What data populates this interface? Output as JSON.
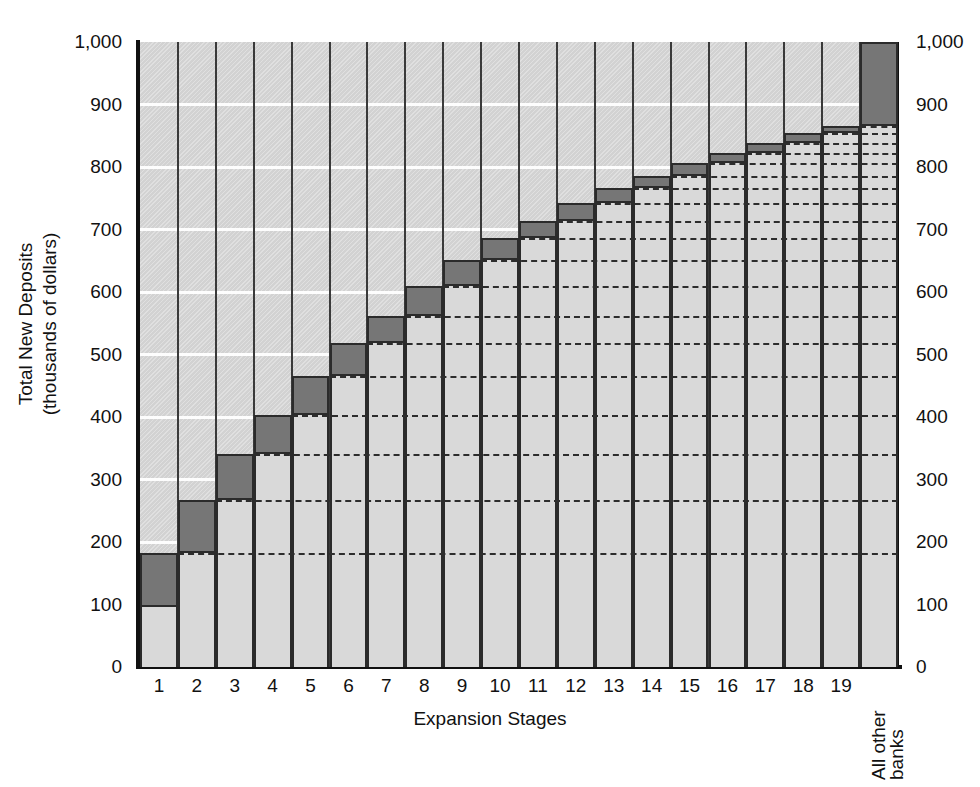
{
  "chart_data": {
    "type": "bar",
    "title": "",
    "xlabel": "Expansion Stages",
    "ylabel_line1": "Total New Deposits",
    "ylabel_line2": "(thousands of dollars)",
    "ylim": [
      0,
      1000
    ],
    "ytick_labels": [
      "0",
      "100",
      "200",
      "300",
      "400",
      "500",
      "600",
      "700",
      "800",
      "900",
      "1,000"
    ],
    "ytick_values": [
      0,
      100,
      200,
      300,
      400,
      500,
      600,
      700,
      800,
      900,
      1000
    ],
    "grid": "horizontal-white-major",
    "legend": "none",
    "categories": [
      "1",
      "2",
      "3",
      "4",
      "5",
      "6",
      "7",
      "8",
      "9",
      "10",
      "11",
      "12",
      "13",
      "14",
      "15",
      "16",
      "17",
      "18",
      "19",
      "All other banks"
    ],
    "category_rotated": [
      false,
      false,
      false,
      false,
      false,
      false,
      false,
      false,
      false,
      false,
      false,
      false,
      false,
      false,
      false,
      false,
      false,
      false,
      false,
      true
    ],
    "series": [
      {
        "name": "Cumulative total new deposits",
        "values": [
          183,
          268,
          341,
          403,
          466,
          519,
          561,
          610,
          652,
          687,
          714,
          742,
          766,
          786,
          806,
          823,
          839,
          854,
          866,
          1000
        ]
      },
      {
        "name": "Carried-over deposits (light segment base)",
        "values": [
          96,
          183,
          268,
          341,
          403,
          466,
          519,
          561,
          610,
          652,
          687,
          714,
          742,
          766,
          786,
          806,
          823,
          839,
          854,
          866
        ]
      }
    ],
    "increment_segment_color": "#767676",
    "carryover_segment_color": "#d9d9d9",
    "plot_background_color": "#d2d2d2",
    "gridline_color": "#fdfdfd",
    "dashed_level_color": "#2d2d2d",
    "axis_color": "#111111"
  }
}
